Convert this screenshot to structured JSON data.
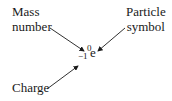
{
  "diagram": {
    "labels": {
      "mass_number": [
        "Mass",
        "number"
      ],
      "particle_symbol": [
        "Particle",
        "symbol"
      ],
      "charge": "Charge"
    },
    "notation": {
      "mass_number": "0",
      "charge": "−1",
      "symbol": "e"
    },
    "arrows": [
      {
        "from": "mass_number",
        "to": "notation.mass_number"
      },
      {
        "from": "particle_symbol",
        "to": "notation.symbol"
      },
      {
        "from": "charge",
        "to": "notation.charge"
      }
    ],
    "colors": {
      "text": "#1a1a1a",
      "arrow": "#1a1a1a",
      "background": "#ffffff"
    }
  }
}
